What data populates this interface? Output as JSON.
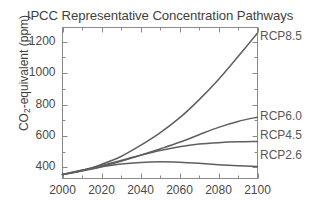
{
  "chart_data": {
    "type": "line",
    "title": "IPCC Representative Concentration Pathways",
    "xlabel": "",
    "ylabel": "CO2-equivalent (ppm)",
    "ylabel_parts": {
      "pre": "CO",
      "sub": "2",
      "post": "-equivalent (ppm)"
    },
    "xlim": [
      2000,
      2100
    ],
    "ylim": [
      330,
      1290
    ],
    "xticks": [
      2000,
      2020,
      2040,
      2060,
      2080,
      2100
    ],
    "yticks": [
      400,
      600,
      800,
      1000,
      1200
    ],
    "minor_ticks": true,
    "grid": false,
    "legend_position": "right-of-line-ends",
    "x": [
      2000,
      2010,
      2020,
      2030,
      2040,
      2050,
      2060,
      2070,
      2080,
      2090,
      2100
    ],
    "series": [
      {
        "name": "RCP8.5",
        "color": "#5f5f5f",
        "values": [
          355,
          380,
          420,
          470,
          540,
          620,
          715,
          830,
          960,
          1105,
          1255
        ],
        "label_y_px": 41
      },
      {
        "name": "RCP6.0",
        "color": "#5f5f5f",
        "values": [
          355,
          378,
          405,
          440,
          478,
          518,
          560,
          608,
          655,
          693,
          720
        ],
        "label_y_px": 121
      },
      {
        "name": "RCP4.5",
        "color": "#5f5f5f",
        "values": [
          355,
          382,
          412,
          445,
          478,
          508,
          532,
          549,
          558,
          563,
          565
        ],
        "label_y_px": 140
      },
      {
        "name": "RCP2.6",
        "color": "#5f5f5f",
        "values": [
          355,
          382,
          405,
          422,
          432,
          437,
          434,
          427,
          418,
          411,
          406
        ],
        "label_y_px": 160
      }
    ],
    "axis_color": "#8a8a8a",
    "text_color": "#4a4a4a",
    "background": "#ffffff"
  }
}
